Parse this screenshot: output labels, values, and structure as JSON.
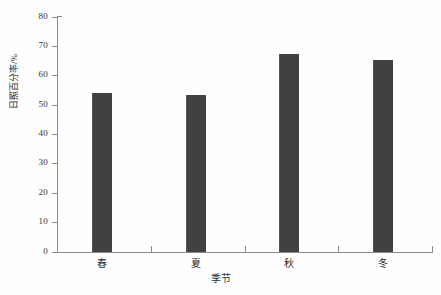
{
  "chart_data": {
    "type": "bar",
    "title": "",
    "subtitle": "",
    "xlabel": "季节",
    "ylabel": "日照百分率/%",
    "categories": [
      "春",
      "夏",
      "秋",
      "冬"
    ],
    "values": [
      54.0,
      53.5,
      67.5,
      65.3
    ],
    "series": [
      {
        "name": "日照百分率",
        "values": [
          54.0,
          53.5,
          67.5,
          65.3
        ]
      }
    ],
    "ylim": [
      0,
      80
    ],
    "ytick_labels": [
      "0",
      "10",
      "20",
      "30",
      "40",
      "50",
      "60",
      "70",
      "80"
    ],
    "ytick_values": [
      0,
      10,
      20,
      30,
      40,
      50,
      60,
      70,
      80
    ],
    "grid": false,
    "legend": null,
    "legend_position": "none",
    "bar_color": "#414141",
    "axis_color": "#8a8a8a",
    "background_color": "#fefefe",
    "annotations": []
  }
}
